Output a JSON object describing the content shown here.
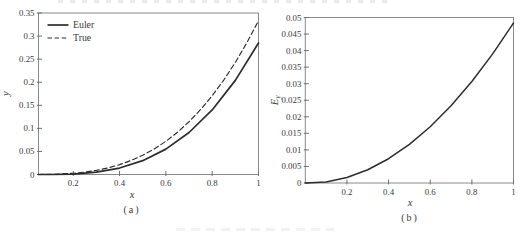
{
  "figure": {
    "description_colors": {
      "curve": "#2d2d2d",
      "frame": "#8a8a8a",
      "tick": "#6f6f6f",
      "text": "#3a3a3a",
      "background": "#ffffff"
    }
  },
  "chart_data": [
    {
      "type": "line",
      "caption": "(a)",
      "xlabel": "x",
      "ylabel": "y",
      "xlim": [
        0.05,
        1
      ],
      "ylim": [
        0,
        0.35
      ],
      "grid": false,
      "xticks": [
        0.2,
        0.4,
        0.6,
        0.8,
        1
      ],
      "xtick_labels": [
        "0.2",
        "0.4",
        "0.6",
        "0.8",
        "1"
      ],
      "yticks": [
        0,
        0.05,
        0.1,
        0.15,
        0.2,
        0.25,
        0.3,
        0.35
      ],
      "ytick_labels": [
        "0",
        "0.05",
        "0.1",
        "0.15",
        "0.2",
        "0.25",
        "0.3",
        "0.35"
      ],
      "legend": {
        "position": "top-left",
        "frame": false,
        "entries": [
          {
            "label": "Euler",
            "line": "solid"
          },
          {
            "label": "True",
            "line": "dashed"
          }
        ]
      },
      "series": [
        {
          "name": "Euler",
          "line": "solid",
          "x": [
            0.05,
            0.1,
            0.2,
            0.3,
            0.4,
            0.5,
            0.6,
            0.7,
            0.8,
            0.9,
            1.0
          ],
          "y": [
            0,
            0,
            0.001,
            0.005,
            0.014,
            0.03,
            0.055,
            0.091,
            0.14,
            0.204,
            0.285
          ]
        },
        {
          "name": "True",
          "line": "dashed",
          "x": [
            0.05,
            0.1,
            0.15,
            0.2,
            0.25,
            0.3,
            0.35,
            0.4,
            0.45,
            0.5,
            0.55,
            0.6,
            0.65,
            0.7,
            0.75,
            0.8,
            0.85,
            0.9,
            0.95,
            1.0
          ],
          "y": [
            4e-05,
            0.00033,
            0.00113,
            0.00267,
            0.00521,
            0.009,
            0.01429,
            0.02133,
            0.03038,
            0.04167,
            0.05546,
            0.072,
            0.09154,
            0.11433,
            0.14063,
            0.17067,
            0.20471,
            0.243,
            0.28579,
            0.33333
          ]
        }
      ]
    },
    {
      "type": "line",
      "caption": "(b)",
      "xlabel": "x",
      "ylabel": "E_y",
      "xlim": [
        0,
        1
      ],
      "ylim": [
        0,
        0.05
      ],
      "grid": false,
      "xticks": [
        0.2,
        0.4,
        0.6,
        0.8,
        1
      ],
      "xtick_labels": [
        "0.2",
        "0.4",
        "0.6",
        "0.8",
        "1"
      ],
      "yticks": [
        0,
        0.005,
        0.01,
        0.015,
        0.02,
        0.025,
        0.03,
        0.035,
        0.04,
        0.045,
        0.05
      ],
      "ytick_labels": [
        "0",
        "0.005",
        "0.01",
        "0.015",
        "0.02",
        "0.025",
        "0.03",
        "0.035",
        "0.04",
        "0.045",
        "0.05"
      ],
      "series": [
        {
          "name": "Ey",
          "line": "solid",
          "x": [
            0,
            0.1,
            0.2,
            0.3,
            0.4,
            0.5,
            0.6,
            0.7,
            0.8,
            0.9,
            1.0
          ],
          "y": [
            0,
            0.00033,
            0.00167,
            0.004,
            0.00733,
            0.01167,
            0.017,
            0.02333,
            0.03067,
            0.039,
            0.04833
          ]
        }
      ]
    }
  ]
}
